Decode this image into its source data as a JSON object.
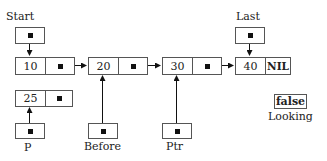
{
  "pointers": {
    "start": {
      "label": "Start"
    },
    "last": {
      "label": "Last"
    },
    "before": {
      "label": "Before"
    },
    "ptr": {
      "label": "Ptr"
    },
    "p": {
      "label": "P"
    }
  },
  "list_nodes": [
    {
      "value": "10",
      "next": "pointer"
    },
    {
      "value": "20",
      "next": "pointer"
    },
    {
      "value": "30",
      "next": "pointer"
    },
    {
      "value": "40",
      "next": "NIL"
    }
  ],
  "new_node": {
    "value": "25",
    "next": "pointer"
  },
  "flag": {
    "value": "false",
    "label": "Looking"
  }
}
